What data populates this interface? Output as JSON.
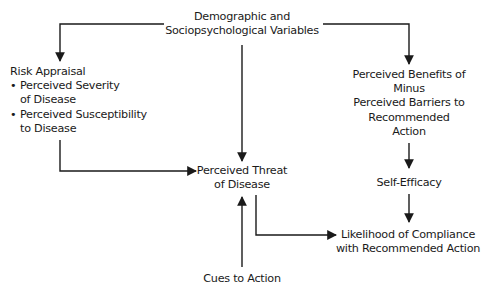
{
  "diagram": {
    "type": "flowchart",
    "nodes": {
      "demographic": {
        "lines": [
          "Demographic and",
          "Sociopsychological Variables"
        ]
      },
      "risk_appraisal": {
        "heading": "Risk Appraisal",
        "bullets": [
          {
            "marker": "•",
            "lines": [
              "Perceived Severity",
              "of Disease"
            ]
          },
          {
            "marker": "•",
            "lines": [
              "Perceived Susceptibility",
              "to Disease"
            ]
          }
        ]
      },
      "benefits": {
        "lines": [
          "Perceived Benefits of",
          "Minus",
          "Perceived Barriers to",
          "Recommended",
          "Action"
        ]
      },
      "threat": {
        "lines": [
          "Perceived Threat",
          "of Disease"
        ]
      },
      "self_efficacy": {
        "lines": [
          "Self-Efficacy"
        ]
      },
      "likelihood": {
        "lines": [
          "Likelihood of Compliance",
          "with Recommended Action"
        ]
      },
      "cues": {
        "lines": [
          "Cues to Action"
        ]
      }
    },
    "edges": [
      {
        "from": "demographic",
        "to": "risk_appraisal"
      },
      {
        "from": "demographic",
        "to": "benefits"
      },
      {
        "from": "demographic",
        "to": "threat"
      },
      {
        "from": "risk_appraisal",
        "to": "threat"
      },
      {
        "from": "cues",
        "to": "threat"
      },
      {
        "from": "threat",
        "to": "likelihood"
      },
      {
        "from": "benefits",
        "to": "self_efficacy"
      },
      {
        "from": "self_efficacy",
        "to": "likelihood"
      }
    ],
    "colors": {
      "line": "#1a1a1a",
      "text": "#1a1a1a",
      "background": "#ffffff"
    }
  }
}
